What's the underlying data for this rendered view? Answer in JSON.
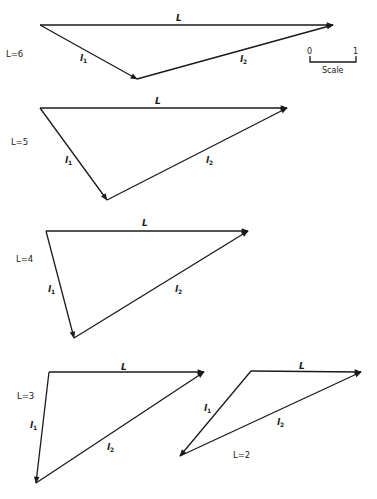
{
  "figure": {
    "scale": {
      "min_label": "0",
      "max_label": "1",
      "caption": "Scale"
    },
    "triangles": [
      {
        "id": "L6",
        "case_label": "L=6",
        "edge_labels": {
          "L": "L",
          "l1": "l",
          "l1_sub": "1",
          "l2": "l",
          "l2_sub": "2"
        },
        "vertices": {
          "origin": [
            40,
            25
          ],
          "end": [
            333,
            25
          ],
          "joint": [
            137,
            79
          ]
        },
        "label_pos": {
          "L": [
            176,
            21
          ],
          "case": [
            6,
            57
          ],
          "l1": [
            80,
            61
          ],
          "l2": [
            240,
            62
          ]
        }
      },
      {
        "id": "L5",
        "case_label": "L=5",
        "edge_labels": {
          "L": "L",
          "l1": "l",
          "l1_sub": "1",
          "l2": "l",
          "l2_sub": "2"
        },
        "vertices": {
          "origin": [
            40,
            108
          ],
          "end": [
            287,
            108
          ],
          "joint": [
            107,
            200
          ]
        },
        "label_pos": {
          "L": [
            155,
            104
          ],
          "case": [
            11,
            145
          ],
          "l1": [
            65,
            163
          ],
          "l2": [
            206,
            163
          ]
        }
      },
      {
        "id": "L4",
        "case_label": "L=4",
        "edge_labels": {
          "L": "L",
          "l1": "l",
          "l1_sub": "1",
          "l2": "l",
          "l2_sub": "2"
        },
        "vertices": {
          "origin": [
            46,
            231
          ],
          "end": [
            248,
            231
          ],
          "joint": [
            74,
            338
          ]
        },
        "label_pos": {
          "L": [
            142,
            226
          ],
          "case": [
            16,
            262
          ],
          "l1": [
            48,
            292
          ],
          "l2": [
            175,
            292
          ]
        }
      },
      {
        "id": "L3",
        "case_label": "L=3",
        "edge_labels": {
          "L": "L",
          "l1": "l",
          "l1_sub": "1",
          "l2": "l",
          "l2_sub": "2"
        },
        "vertices": {
          "origin": [
            49,
            372
          ],
          "end": [
            204,
            372
          ],
          "joint": [
            36,
            483
          ]
        },
        "label_pos": {
          "L": [
            121,
            370
          ],
          "case": [
            17,
            399
          ],
          "l1": [
            30,
            428
          ],
          "l2": [
            107,
            450
          ]
        }
      },
      {
        "id": "L2",
        "case_label": "L=2",
        "edge_labels": {
          "L": "L",
          "l1": "l",
          "l1_sub": "1",
          "l2": "l",
          "l2_sub": "2"
        },
        "vertices": {
          "origin": [
            251,
            371
          ],
          "end": [
            361,
            372
          ],
          "joint": [
            180,
            456
          ]
        },
        "label_pos": {
          "L": [
            299,
            369
          ],
          "case": [
            233,
            458
          ],
          "l1": [
            204,
            411
          ],
          "l2": [
            277,
            425
          ]
        }
      }
    ]
  }
}
